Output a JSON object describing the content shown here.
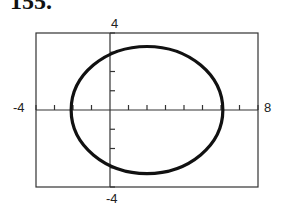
{
  "header": {
    "exercise_number": "155."
  },
  "chart_data": {
    "type": "line",
    "title": "",
    "xlabel": "",
    "ylabel": "",
    "xlim": [
      -4,
      8
    ],
    "ylim": [
      -4,
      4
    ],
    "x_ticks_step": 1,
    "y_ticks_step": 1,
    "grid": false,
    "tick_labels": {
      "xmin": "-4",
      "xmax": "8",
      "ymin": "-4",
      "ymax": "4"
    },
    "series": [
      {
        "name": "ellipse",
        "shape": "ellipse",
        "center": [
          2,
          0
        ],
        "semi_axis_x": 4.1,
        "semi_axis_y": 3.3
      }
    ]
  }
}
